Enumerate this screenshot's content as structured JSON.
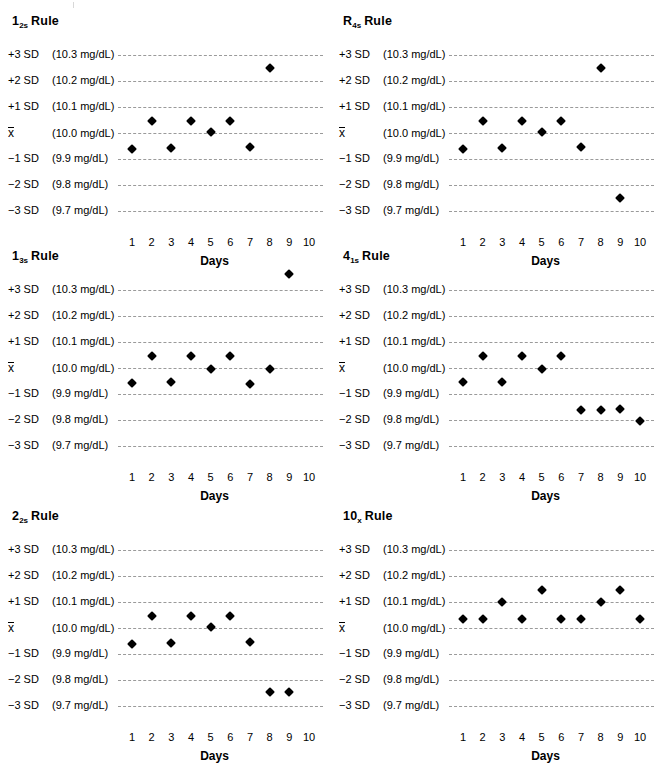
{
  "chart_data": [
    {
      "type": "scatter",
      "title": "1_2s Rule",
      "title_base": "1",
      "title_sub": "2s",
      "title_word": "Rule",
      "xlabel": "Days",
      "ylabel": "",
      "x": [
        1,
        2,
        3,
        4,
        5,
        6,
        7,
        8,
        9,
        10
      ],
      "ylim": [
        9.65,
        10.35
      ],
      "grid": true,
      "ytick_labels": [
        "+3 SD",
        "+2 SD",
        "+1 SD",
        "x̄",
        "−1 SD",
        "−2 SD",
        "−3 SD"
      ],
      "ytick_values": [
        "(10.3 mg/dL)",
        "(10.2 mg/dL)",
        "(10.1 mg/dL)",
        "(10.0 mg/dL)",
        "(9.9 mg/dL)",
        "(9.8 mg/dL)",
        "(9.7 mg/dL)"
      ],
      "ytick_sd": [
        3,
        2,
        1,
        0,
        -1,
        -2,
        -3
      ],
      "points_sd": [
        -0.6,
        0.45,
        -0.58,
        0.46,
        0.02,
        0.47,
        -0.55,
        2.5
      ],
      "points_mgdl": [
        9.94,
        10.05,
        9.94,
        10.05,
        10.0,
        10.05,
        9.95,
        10.25
      ]
    },
    {
      "type": "scatter",
      "title": "R_4s Rule",
      "title_base": "R",
      "title_sub": "4s",
      "title_word": "Rule",
      "xlabel": "Days",
      "ylabel": "",
      "x": [
        1,
        2,
        3,
        4,
        5,
        6,
        7,
        8,
        9,
        10
      ],
      "ylim": [
        9.65,
        10.35
      ],
      "grid": true,
      "ytick_labels": [
        "+3 SD",
        "+2 SD",
        "+1 SD",
        "x̄",
        "−1 SD",
        "−2 SD",
        "−3 SD"
      ],
      "ytick_values": [
        "(10.3 mg/dL)",
        "(10.2 mg/dL)",
        "(10.1 mg/dL)",
        "(10.0 mg/dL)",
        "(9.9 mg/dL)",
        "(9.8 mg/dL)",
        "(9.7 mg/dL)"
      ],
      "ytick_sd": [
        3,
        2,
        1,
        0,
        -1,
        -2,
        -3
      ],
      "points_sd": [
        -0.6,
        0.45,
        -0.58,
        0.46,
        0.02,
        0.47,
        -0.55,
        2.5,
        -2.5
      ],
      "points_mgdl": [
        9.94,
        10.05,
        9.94,
        10.05,
        10.0,
        10.05,
        9.95,
        10.25,
        9.75
      ]
    },
    {
      "type": "scatter",
      "title": "1_3s Rule",
      "title_base": "1",
      "title_sub": "3s",
      "title_word": "Rule",
      "xlabel": "Days",
      "ylabel": "",
      "x": [
        1,
        2,
        3,
        4,
        5,
        6,
        7,
        8,
        9,
        10
      ],
      "ylim": [
        9.65,
        10.35
      ],
      "grid": true,
      "ytick_labels": [
        "+3 SD",
        "+2 SD",
        "+1 SD",
        "x̄",
        "−1 SD",
        "−2 SD",
        "−3 SD"
      ],
      "ytick_values": [
        "(10.3 mg/dL)",
        "(10.2 mg/dL)",
        "(10.1 mg/dL)",
        "(10.0 mg/dL)",
        "(9.9 mg/dL)",
        "(9.8 mg/dL)",
        "(9.7 mg/dL)"
      ],
      "ytick_sd": [
        3,
        2,
        1,
        0,
        -1,
        -2,
        -3
      ],
      "points_sd": [
        -0.58,
        0.45,
        -0.55,
        0.46,
        -0.05,
        0.46,
        -0.6,
        -0.05,
        3.6
      ],
      "points_mgdl": [
        9.94,
        10.05,
        9.95,
        10.05,
        10.0,
        10.05,
        9.94,
        10.0,
        10.36
      ]
    },
    {
      "type": "scatter",
      "title": "4_1s Rule",
      "title_base": "4",
      "title_sub": "1s",
      "title_word": "Rule",
      "xlabel": "Days",
      "ylabel": "",
      "x": [
        1,
        2,
        3,
        4,
        5,
        6,
        7,
        8,
        9,
        10
      ],
      "ylim": [
        9.65,
        10.35
      ],
      "grid": true,
      "ytick_labels": [
        "+3 SD",
        "+2 SD",
        "+1 SD",
        "x̄",
        "−1 SD",
        "−2 SD",
        "−3 SD"
      ],
      "ytick_values": [
        "(10.3 mg/dL)",
        "(10.2 mg/dL)",
        "(10.1 mg/dL)",
        "(10.0 mg/dL)",
        "(9.9 mg/dL)",
        "(9.8 mg/dL)",
        "(9.7 mg/dL)"
      ],
      "ytick_sd": [
        3,
        2,
        1,
        0,
        -1,
        -2,
        -3
      ],
      "points_sd": [
        -0.55,
        0.46,
        -0.55,
        0.46,
        -0.02,
        0.46,
        -1.62,
        -1.62,
        -1.58,
        -2.05
      ],
      "points_mgdl": [
        9.95,
        10.05,
        9.95,
        10.05,
        10.0,
        10.05,
        9.84,
        9.84,
        9.84,
        9.8
      ]
    },
    {
      "type": "scatter",
      "title": "2_2s Rule",
      "title_base": "2",
      "title_sub": "2s",
      "title_word": "Rule",
      "xlabel": "Days",
      "ylabel": "",
      "x": [
        1,
        2,
        3,
        4,
        5,
        6,
        7,
        8,
        9,
        10
      ],
      "ylim": [
        9.65,
        10.35
      ],
      "grid": true,
      "ytick_labels": [
        "+3 SD",
        "+2 SD",
        "+1 SD",
        "x̄",
        "−1 SD",
        "−2 SD",
        "−3 SD"
      ],
      "ytick_values": [
        "(10.3 mg/dL)",
        "(10.2 mg/dL)",
        "(10.1 mg/dL)",
        "(10.0 mg/dL)",
        "(9.9 mg/dL)",
        "(9.8 mg/dL)",
        "(9.7 mg/dL)"
      ],
      "ytick_sd": [
        3,
        2,
        1,
        0,
        -1,
        -2,
        -3
      ],
      "points_sd": [
        -0.6,
        0.45,
        -0.58,
        0.46,
        0.02,
        0.46,
        -0.55,
        -2.45,
        -2.45
      ],
      "points_mgdl": [
        9.94,
        10.05,
        9.94,
        10.05,
        10.0,
        10.05,
        9.95,
        9.76,
        9.76
      ]
    },
    {
      "type": "scatter",
      "title": "10_x Rule",
      "title_base": "10",
      "title_sub": "x",
      "title_word": "Rule",
      "xlabel": "Days",
      "ylabel": "",
      "x": [
        1,
        2,
        3,
        4,
        5,
        6,
        7,
        8,
        9,
        10
      ],
      "ylim": [
        9.65,
        10.35
      ],
      "grid": true,
      "ytick_labels": [
        "+3 SD",
        "+2 SD",
        "+1 SD",
        "x̄",
        "−1 SD",
        "−2 SD",
        "−3 SD"
      ],
      "ytick_values": [
        "(10.3 mg/dL)",
        "(10.2 mg/dL)",
        "(10.1 mg/dL)",
        "(10.0 mg/dL)",
        "(9.9 mg/dL)",
        "(9.8 mg/dL)",
        "(9.7 mg/dL)"
      ],
      "ytick_sd": [
        3,
        2,
        1,
        0,
        -1,
        -2,
        -3
      ],
      "points_sd": [
        0.35,
        0.35,
        1.0,
        0.35,
        1.45,
        0.35,
        0.33,
        1.0,
        1.45,
        0.33
      ],
      "points_mgdl": [
        10.04,
        10.04,
        10.1,
        10.04,
        10.15,
        10.04,
        10.03,
        10.1,
        10.15,
        10.03
      ]
    }
  ]
}
